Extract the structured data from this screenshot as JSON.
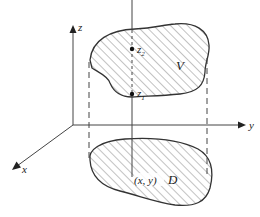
{
  "diagram": {
    "type": "triple-integral-region",
    "axes": {
      "x_label": "x",
      "y_label": "y",
      "z_label": "z"
    },
    "regions": {
      "solid_label": "V",
      "base_label": "D"
    },
    "points": {
      "upper_bound_label": "z",
      "upper_bound_sub": "2",
      "lower_bound_label": "z",
      "lower_bound_sub": "1",
      "base_point_label": "(x, y)"
    },
    "colors": {
      "stroke": "#333333",
      "hatch": "#555555",
      "background": "#ffffff"
    }
  }
}
